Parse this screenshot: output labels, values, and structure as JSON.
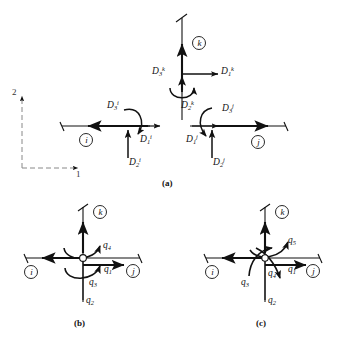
{
  "figure": {
    "background": "#ffffff",
    "ink": "#111111",
    "axis_color": "#777777",
    "panels": [
      {
        "id": "a",
        "caption": "(a)",
        "description": "Member end displacements for members i, j, k at a joint",
        "axes": {
          "vertical_label": "2",
          "horizontal_label": "1",
          "style": "dashed"
        },
        "members": [
          {
            "name": "member-i",
            "circle_label": "i",
            "displacements": [
              {
                "symbol": "D",
                "sub": "1",
                "sup": "i",
                "kind": "translation",
                "direction": "right"
              },
              {
                "symbol": "D",
                "sub": "2",
                "sup": "i",
                "kind": "translation",
                "direction": "up"
              },
              {
                "symbol": "D",
                "sub": "3",
                "sup": "i",
                "kind": "rotation",
                "direction": "counterclockwise"
              }
            ]
          },
          {
            "name": "member-j",
            "circle_label": "j",
            "displacements": [
              {
                "symbol": "D",
                "sub": "1",
                "sup": "j",
                "kind": "translation",
                "direction": "right"
              },
              {
                "symbol": "D",
                "sub": "2",
                "sup": "j",
                "kind": "translation",
                "direction": "up"
              },
              {
                "symbol": "D",
                "sub": "3",
                "sup": "j",
                "kind": "rotation",
                "direction": "counterclockwise"
              }
            ]
          },
          {
            "name": "member-k",
            "circle_label": "k",
            "displacements": [
              {
                "symbol": "D",
                "sub": "1",
                "sup": "k",
                "kind": "translation",
                "direction": "right"
              },
              {
                "symbol": "D",
                "sub": "2",
                "sup": "k",
                "kind": "translation",
                "direction": "up"
              },
              {
                "symbol": "D",
                "sub": "3",
                "sup": "k",
                "kind": "rotation",
                "direction": "counterclockwise"
              }
            ]
          }
        ]
      },
      {
        "id": "b",
        "caption": "(b)",
        "description": "Joint displacements q1 through q4 at a rigid connection of members i, j, k",
        "members": [
          "i",
          "j",
          "k"
        ],
        "displacements": [
          {
            "symbol": "q",
            "sub": "1",
            "kind": "translation",
            "direction": "right"
          },
          {
            "symbol": "q",
            "sub": "2",
            "kind": "translation",
            "direction": "up"
          },
          {
            "symbol": "q",
            "sub": "3",
            "kind": "rotation",
            "direction": "counterclockwise"
          },
          {
            "symbol": "q",
            "sub": "4",
            "kind": "rotation",
            "direction": "counterclockwise"
          }
        ]
      },
      {
        "id": "c",
        "caption": "(c)",
        "description": "Joint displacements q1 through q5 at a connection of members i, j, k",
        "members": [
          "i",
          "j",
          "k"
        ],
        "displacements": [
          {
            "symbol": "q",
            "sub": "1",
            "kind": "translation",
            "direction": "right"
          },
          {
            "symbol": "q",
            "sub": "2",
            "kind": "translation",
            "direction": "up"
          },
          {
            "symbol": "q",
            "sub": "3",
            "kind": "rotation",
            "direction": "counterclockwise"
          },
          {
            "symbol": "q",
            "sub": "4",
            "kind": "rotation",
            "direction": "clockwise"
          },
          {
            "symbol": "q",
            "sub": "5",
            "kind": "rotation",
            "direction": "counterclockwise"
          }
        ]
      }
    ]
  },
  "labels": {
    "panel_a": {
      "axis_2": "2",
      "axis_1": "1",
      "caption": "(a)",
      "member_i": "i",
      "member_j": "j",
      "member_k": "k",
      "d1i": "D",
      "d1i_sub": "1",
      "d1i_sup": "i",
      "d2i": "D",
      "d2i_sub": "2",
      "d2i_sup": "i",
      "d3i": "D",
      "d3i_sub": "3",
      "d3i_sup": "i",
      "d1j": "D",
      "d1j_sub": "1",
      "d1j_sup": "j",
      "d2j": "D",
      "d2j_sub": "2",
      "d2j_sup": "j",
      "d3j": "D",
      "d3j_sub": "3",
      "d3j_sup": "j",
      "d1k": "D",
      "d1k_sub": "1",
      "d1k_sup": "k",
      "d2k": "D",
      "d2k_sub": "2",
      "d2k_sup": "k",
      "d3k": "D",
      "d3k_sub": "3",
      "d3k_sup": "k"
    },
    "panel_b": {
      "caption": "(b)",
      "member_i": "i",
      "member_j": "j",
      "member_k": "k",
      "q1": "q",
      "q1_sub": "1",
      "q2": "q",
      "q2_sub": "2",
      "q3": "q",
      "q3_sub": "3",
      "q4": "q",
      "q4_sub": "4"
    },
    "panel_c": {
      "caption": "(c)",
      "member_i": "i",
      "member_j": "j",
      "member_k": "k",
      "q1": "q",
      "q1_sub": "1",
      "q2": "q",
      "q2_sub": "2",
      "q3": "q",
      "q3_sub": "3",
      "q4": "q",
      "q4_sub": "4",
      "q5": "q",
      "q5_sub": "5"
    }
  }
}
